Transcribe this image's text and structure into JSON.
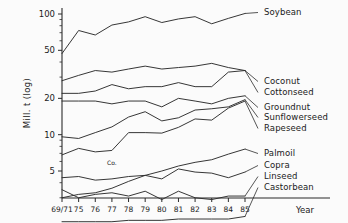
{
  "chart_data": {
    "type": "line",
    "title": "",
    "xlabel": "Year",
    "ylabel": "Mill. t (log)",
    "yscale": "log",
    "ylim": [
      1.5,
      120
    ],
    "grid": false,
    "legend_position": "right-inline",
    "y_ticks": [
      {
        "value": 100,
        "label": "100"
      },
      {
        "value": 50,
        "label": "50"
      },
      {
        "value": 20,
        "label": "20"
      },
      {
        "value": 10,
        "label": "10"
      },
      {
        "value": 5,
        "label": "5"
      }
    ],
    "y_minor_ticks": [
      90,
      80,
      70,
      60,
      40,
      30,
      9,
      8,
      7,
      6,
      4,
      3,
      2
    ],
    "categories": [
      "69/71",
      "75",
      "76",
      "77",
      "78",
      "79",
      "80",
      "81",
      "82",
      "83",
      "84",
      "85"
    ],
    "annotations": [
      {
        "text": "Co.",
        "x_category": "77",
        "value": 5.6
      }
    ],
    "series": [
      {
        "name": "Soybean",
        "label": "Soybean",
        "values": [
          47,
          73,
          67,
          81,
          86,
          95,
          85,
          91,
          95,
          83,
          92,
          101
        ]
      },
      {
        "name": "Coconut",
        "label": "Coconut",
        "values": [
          28,
          31,
          34,
          33,
          35,
          37,
          35,
          36,
          37,
          39,
          36,
          34
        ]
      },
      {
        "name": "Cottonseed",
        "label": "Cottonseed",
        "values": [
          22,
          22,
          23,
          26,
          24,
          25,
          25,
          27,
          25,
          25,
          33,
          34
        ]
      },
      {
        "name": "Groundnut",
        "label": "Groundnut",
        "values": [
          19,
          19,
          19,
          18,
          19,
          19,
          17,
          20,
          19,
          18,
          20,
          21
        ]
      },
      {
        "name": "Sunflowerseed",
        "label": "Sunflowerseed",
        "values": [
          9.6,
          9.3,
          10.4,
          11.6,
          14,
          15.5,
          13,
          13.8,
          16,
          16.4,
          17,
          19.5
        ]
      },
      {
        "name": "Rapeseed",
        "label": "Rapeseed",
        "values": [
          6.8,
          7.7,
          7.2,
          7.4,
          10.4,
          10.4,
          10.3,
          11.5,
          13.5,
          13.2,
          16.6,
          19
        ]
      },
      {
        "name": "Palmoil",
        "label": "Palmoil",
        "values": [
          3.0,
          3.2,
          3.3,
          3.6,
          4.1,
          4.6,
          5.0,
          5.5,
          5.9,
          6.2,
          6.9,
          7.6
        ]
      },
      {
        "name": "Copra",
        "label": "Copra",
        "values": [
          4.4,
          4.5,
          4.2,
          4.3,
          4.5,
          4.6,
          4.3,
          5.2,
          4.9,
          4.8,
          4.4,
          4.9
        ]
      },
      {
        "name": "Linseed",
        "label": "Linseed",
        "values": [
          3.5,
          3.0,
          3.2,
          3.3,
          3.1,
          3.4,
          2.9,
          3.4,
          3.0,
          2.9,
          3.1,
          3.1
        ]
      },
      {
        "name": "Castorbean",
        "label": "Castorbean",
        "values": [
          1.9,
          1.9,
          1.9,
          1.9,
          1.95,
          1.95,
          1.95,
          2.0,
          2.0,
          2.0,
          2.0,
          2.1
        ]
      }
    ]
  },
  "axis": {
    "y_title": "Mill. t (log)",
    "x_title": "Year"
  }
}
